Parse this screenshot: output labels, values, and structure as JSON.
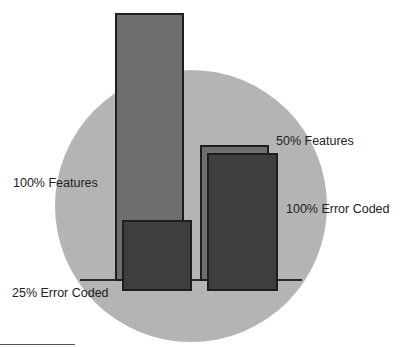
{
  "diagram": {
    "labels": {
      "features_100": "100% Features",
      "error_coded_25": "25% Error Coded",
      "features_50": "50% Features",
      "error_coded_100": "100% Error Coded"
    },
    "colors": {
      "background_circle": "#b4b4b4",
      "feature_bar": "#6e6e6e",
      "error_coded_bar": "#3e3e3e",
      "outline": "#1e1e1e"
    }
  }
}
